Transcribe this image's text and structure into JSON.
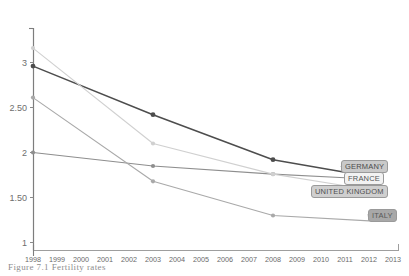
{
  "chart_data": {
    "type": "line",
    "title": "",
    "xlabel": "",
    "ylabel": "",
    "x": [
      1998,
      1999,
      2000,
      2001,
      2002,
      2003,
      2004,
      2005,
      2006,
      2007,
      2008,
      2009,
      2010,
      2011,
      2012,
      2013
    ],
    "xlim": [
      1998,
      2013
    ],
    "ylim": [
      1.0,
      3.2
    ],
    "yticks": [
      1,
      1.5,
      2,
      2.5,
      3
    ],
    "ytick_labels": [
      "1",
      "1.50",
      "2",
      "2.50",
      "3"
    ],
    "xtick_labels": [
      "1998",
      "1999",
      "2000",
      "2001",
      "2002",
      "2003",
      "2004",
      "2005",
      "2006",
      "2007",
      "2008",
      "2009",
      "2010",
      "2011",
      "2012",
      "2013"
    ],
    "grid": false,
    "legend_position": "right-inline-labels",
    "marker_years": [
      1998,
      2003,
      2008
    ],
    "series": [
      {
        "name": "GERMANY",
        "color": "#4d4d4d",
        "x": [
          1998,
          2003,
          2008,
          2011
        ],
        "values": [
          2.96,
          2.42,
          1.92,
          1.78
        ]
      },
      {
        "name": "FRANCE",
        "color": "#8e8e8e",
        "x": [
          1998,
          2003,
          2008,
          2011
        ],
        "values": [
          2.0,
          1.85,
          1.76,
          1.72
        ]
      },
      {
        "name": "UNITED KINGDOM",
        "color": "#d0d0d0",
        "x": [
          1998,
          2003,
          2008,
          2011
        ],
        "values": [
          3.16,
          2.1,
          1.76,
          1.63
        ]
      },
      {
        "name": "ITALY",
        "color": "#a9a9a9",
        "x": [
          1998,
          2003,
          2008,
          2012
        ],
        "values": [
          2.61,
          1.68,
          1.3,
          1.24
        ]
      }
    ]
  },
  "legend": {
    "germany": "GERMANY",
    "france": "FRANCE",
    "uk": "UNITED KINGDOM",
    "italy": "ITALY"
  },
  "caption": {
    "text": "Figure 7.1  Fertility rates"
  }
}
